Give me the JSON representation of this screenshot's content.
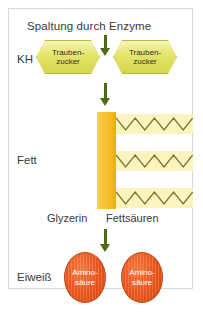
{
  "figure": {
    "title": "Spaltung durch Enzyme",
    "rows": [
      {
        "label": "KH"
      },
      {
        "label": "Fett"
      },
      {
        "label": "Eiweiß"
      }
    ],
    "carbohydrate": {
      "molecules": [
        {
          "line1": "Trauben-",
          "line2": "zucker"
        },
        {
          "line1": "Trauben-",
          "line2": "zucker"
        }
      ]
    },
    "fat": {
      "glycerol_label": "Glyzerin",
      "fatty_acid_label": "Fettsäuren",
      "fatty_acid_count": 3,
      "zigzag_peaks": 4
    },
    "protein": {
      "molecules": [
        {
          "line1": "Amino-",
          "line2": "säure"
        },
        {
          "line1": "Amino-",
          "line2": "säure"
        }
      ]
    },
    "colors": {
      "arrow": "#4a6b17",
      "hexagon_fill": "#e4e46a",
      "hexagon_border": "#b9b93c",
      "glycerol": "#f6c333",
      "fatty_acid_band": "#fbf4c0",
      "fatty_acid_line": "#7a7a2e",
      "amino_acid": "#e8571f",
      "panel_border": "#d8d8d8",
      "text": "#3a3a3a"
    }
  }
}
